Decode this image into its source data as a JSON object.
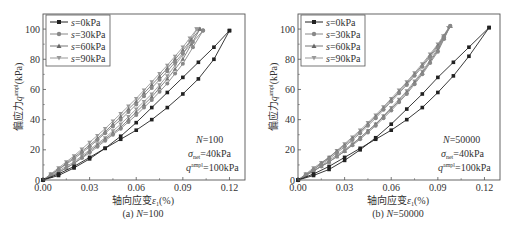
{
  "chart_data": [
    {
      "type": "line",
      "title": "(a) N=100",
      "caption_prefix": "(a) ",
      "caption_var": "N",
      "caption_val": "=100",
      "xlabel": "轴向应变ε1(%)",
      "ylabel": "偏应力q^ampl(kPa)",
      "xlim": [
        0.0,
        0.13
      ],
      "ylim": [
        0,
        110
      ],
      "xticks": [
        "0.00",
        "0.03",
        "0.06",
        "0.09",
        "0.12"
      ],
      "yticks": [
        "0",
        "20",
        "40",
        "60",
        "80",
        "100"
      ],
      "grid": false,
      "legend_position": "upper left",
      "annotations": [
        "N=100",
        "σnet=40kPa",
        "q^ampl=100kPa"
      ],
      "series": [
        {
          "name": "s=0kPa",
          "marker": "square",
          "color": "#222222",
          "loading": {
            "x": [
              0.0,
              0.01,
              0.02,
              0.03,
              0.04,
              0.05,
              0.06,
              0.07,
              0.08,
              0.09,
              0.1,
              0.11,
              0.12
            ],
            "y": [
              0,
              4,
              9,
              15,
              21,
              27,
              33,
              40,
              48,
              57,
              67,
              80,
              99
            ]
          },
          "unloading": {
            "x": [
              0.12,
              0.11,
              0.1,
              0.09,
              0.08,
              0.07,
              0.06,
              0.05,
              0.04,
              0.03,
              0.02,
              0.01,
              0.0
            ],
            "y": [
              99,
              88,
              78,
              68,
              58,
              48,
              38,
              29,
              21,
              14,
              8,
              3,
              0
            ]
          }
        },
        {
          "name": "s=30kPa",
          "marker": "circle",
          "color": "#888888",
          "loading": {
            "x": [
              0.0,
              0.01,
              0.02,
              0.03,
              0.04,
              0.05,
              0.06,
              0.07,
              0.08,
              0.09,
              0.103
            ],
            "y": [
              0,
              5,
              11,
              18,
              26,
              34,
              43,
              53,
              64,
              77,
              99
            ]
          },
          "unloading": {
            "x": [
              0.103,
              0.09,
              0.08,
              0.07,
              0.06,
              0.05,
              0.04,
              0.03,
              0.02,
              0.01,
              0.0
            ],
            "y": [
              99,
              84,
              72,
              61,
              50,
              40,
              31,
              22,
              14,
              7,
              0
            ]
          }
        },
        {
          "name": "s=60kPa",
          "marker": "triangle-up",
          "color": "#777777",
          "loading": {
            "x": [
              0.0,
              0.01,
              0.02,
              0.03,
              0.04,
              0.05,
              0.06,
              0.07,
              0.08,
              0.09,
              0.101
            ],
            "y": [
              0,
              5,
              11,
              19,
              27,
              35,
              45,
              55,
              67,
              80,
              100
            ]
          },
          "unloading": {
            "x": [
              0.101,
              0.09,
              0.08,
              0.07,
              0.06,
              0.05,
              0.04,
              0.03,
              0.02,
              0.01,
              0.0
            ],
            "y": [
              100,
              86,
              74,
              63,
              52,
              42,
              32,
              23,
              15,
              7,
              0
            ]
          }
        },
        {
          "name": "s=90kPa",
          "marker": "triangle-down",
          "color": "#999999",
          "loading": {
            "x": [
              0.0,
              0.01,
              0.02,
              0.03,
              0.04,
              0.05,
              0.06,
              0.07,
              0.08,
              0.09,
              0.099
            ],
            "y": [
              0,
              6,
              12,
              20,
              28,
              37,
              47,
              57,
              69,
              83,
              100
            ]
          },
          "unloading": {
            "x": [
              0.099,
              0.09,
              0.08,
              0.07,
              0.06,
              0.05,
              0.04,
              0.03,
              0.02,
              0.01,
              0.0
            ],
            "y": [
              100,
              88,
              76,
              65,
              54,
              44,
              34,
              25,
              16,
              8,
              0
            ]
          }
        }
      ]
    },
    {
      "type": "line",
      "title": "(b) N=50000",
      "caption_prefix": "(b) ",
      "caption_var": "N",
      "caption_val": "=50000",
      "xlabel": "轴向应变ε1(%)",
      "ylabel": "偏应力q^ampl(kPa)",
      "xlim": [
        0.0,
        0.13
      ],
      "ylim": [
        0,
        110
      ],
      "xticks": [
        "0.00",
        "0.03",
        "0.06",
        "0.09",
        "0.12"
      ],
      "yticks": [
        "0",
        "20",
        "40",
        "60",
        "80",
        "100"
      ],
      "grid": false,
      "legend_position": "upper left",
      "annotations": [
        "N=50000",
        "σnet=40kPa",
        "q^ampl=100kPa"
      ],
      "series": [
        {
          "name": "s=0kPa",
          "marker": "square",
          "color": "#222222",
          "loading": {
            "x": [
              0.0,
              0.01,
              0.02,
              0.03,
              0.04,
              0.05,
              0.06,
              0.07,
              0.08,
              0.09,
              0.1,
              0.11,
              0.123
            ],
            "y": [
              0,
              4,
              9,
              15,
              21,
              27,
              33,
              40,
              48,
              58,
              69,
              82,
              101
            ]
          },
          "unloading": {
            "x": [
              0.123,
              0.11,
              0.1,
              0.09,
              0.08,
              0.07,
              0.06,
              0.05,
              0.04,
              0.03,
              0.02,
              0.01,
              0.0
            ],
            "y": [
              101,
              88,
              78,
              68,
              57,
              47,
              37,
              28,
              20,
              13,
              7,
              3,
              0
            ]
          }
        },
        {
          "name": "s=30kPa",
          "marker": "circle",
          "color": "#888888",
          "loading": {
            "x": [
              0.0,
              0.01,
              0.02,
              0.03,
              0.04,
              0.05,
              0.06,
              0.07,
              0.08,
              0.09,
              0.098
            ],
            "y": [
              0,
              6,
              12,
              19,
              27,
              36,
              46,
              57,
              70,
              85,
              102
            ]
          },
          "unloading": {
            "x": [
              0.098,
              0.09,
              0.08,
              0.07,
              0.06,
              0.05,
              0.04,
              0.03,
              0.02,
              0.01,
              0.0
            ],
            "y": [
              102,
              88,
              75,
              63,
              52,
              41,
              31,
              22,
              14,
              7,
              0
            ]
          }
        },
        {
          "name": "s=60kPa",
          "marker": "triangle-up",
          "color": "#777777",
          "loading": {
            "x": [
              0.0,
              0.01,
              0.02,
              0.03,
              0.04,
              0.05,
              0.06,
              0.07,
              0.08,
              0.09,
              0.098
            ],
            "y": [
              0,
              6,
              12,
              19,
              28,
              37,
              47,
              58,
              71,
              86,
              102
            ]
          },
          "unloading": {
            "x": [
              0.098,
              0.09,
              0.08,
              0.07,
              0.06,
              0.05,
              0.04,
              0.03,
              0.02,
              0.01,
              0.0
            ],
            "y": [
              102,
              89,
              76,
              64,
              53,
              42,
              32,
              23,
              15,
              7,
              0
            ]
          }
        },
        {
          "name": "s=90kPa",
          "marker": "triangle-down",
          "color": "#999999",
          "loading": {
            "x": [
              0.0,
              0.01,
              0.02,
              0.03,
              0.04,
              0.05,
              0.06,
              0.07,
              0.08,
              0.09,
              0.097
            ],
            "y": [
              0,
              6,
              13,
              20,
              28,
              37,
              48,
              59,
              72,
              87,
              101
            ]
          },
          "unloading": {
            "x": [
              0.097,
              0.09,
              0.08,
              0.07,
              0.06,
              0.05,
              0.04,
              0.03,
              0.02,
              0.01,
              0.0
            ],
            "y": [
              101,
              90,
              77,
              65,
              54,
              43,
              33,
              24,
              15,
              8,
              0
            ]
          }
        }
      ]
    }
  ],
  "panels": [
    {
      "caption_prefix": "(a) ",
      "caption_var": "N",
      "caption_val": "=100",
      "xlabel_cn": "轴向应变",
      "xlabel_var": "ε",
      "xlabel_sub": "1",
      "xlabel_unit": "(%)",
      "ylabel_cn": "偏应力",
      "ylabel_var": "q",
      "ylabel_sup": "ampl",
      "ylabel_unit": "(kPa)",
      "anno_N_var": "N",
      "anno_N_val": "=100",
      "anno_sigma_var": "σ",
      "anno_sigma_sub": "net",
      "anno_sigma_val": "=40kPa",
      "anno_q_var": "q",
      "anno_q_sup": "ampl",
      "anno_q_val": "=100kPa",
      "legend": [
        {
          "var": "s",
          "val": "=0kPa"
        },
        {
          "var": "s",
          "val": "=30kPa"
        },
        {
          "var": "s",
          "val": "=60kPa"
        },
        {
          "var": "s",
          "val": "=90kPa"
        }
      ]
    },
    {
      "caption_prefix": "(b) ",
      "caption_var": "N",
      "caption_val": "=50000",
      "xlabel_cn": "轴向应变",
      "xlabel_var": "ε",
      "xlabel_sub": "1",
      "xlabel_unit": "(%)",
      "ylabel_cn": "偏应力",
      "ylabel_var": "q",
      "ylabel_sup": "ampl",
      "ylabel_unit": "(kPa)",
      "anno_N_var": "N",
      "anno_N_val": "=50000",
      "anno_sigma_var": "σ",
      "anno_sigma_sub": "net",
      "anno_sigma_val": "=40kPa",
      "anno_q_var": "q",
      "anno_q_sup": "ampl",
      "anno_q_val": "=100kPa",
      "legend": [
        {
          "var": "s",
          "val": "=0kPa"
        },
        {
          "var": "s",
          "val": "=30kPa"
        },
        {
          "var": "s",
          "val": "=60kPa"
        },
        {
          "var": "s",
          "val": "=90kPa"
        }
      ]
    }
  ]
}
